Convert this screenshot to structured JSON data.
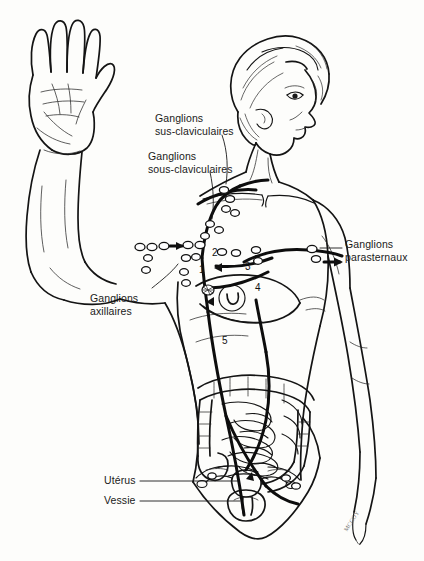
{
  "figure": {
    "language": "fr",
    "background_color": "#fdfdfb",
    "ink_color": "#111111",
    "width": 424,
    "height": 561
  },
  "labels": [
    {
      "id": "supraclavicular",
      "line1": "Ganglions",
      "line2": "sus-claviculaires",
      "x": 155,
      "y": 112,
      "align": "left"
    },
    {
      "id": "infraclavicular",
      "line1": "Ganglions",
      "line2": "sous-claviculaires",
      "x": 148,
      "y": 150,
      "align": "left"
    },
    {
      "id": "parasternal",
      "line1": "Ganglions",
      "line2": "parasternaux",
      "x": 345,
      "y": 238,
      "align": "left"
    },
    {
      "id": "axillary",
      "line1": "Ganglions",
      "line2": "axillaires",
      "x": 90,
      "y": 292,
      "align": "left"
    }
  ],
  "organ_labels": [
    {
      "id": "uterus",
      "text": "Utérus",
      "x": 104,
      "y": 481
    },
    {
      "id": "bladder",
      "text": "Vessie",
      "x": 104,
      "y": 501
    }
  ],
  "number_markers": [
    {
      "id": "marker-1",
      "text": "1",
      "x": 199,
      "y": 265
    },
    {
      "id": "marker-2",
      "text": "2",
      "x": 212,
      "y": 253
    },
    {
      "id": "marker-3",
      "text": "3",
      "x": 245,
      "y": 264
    },
    {
      "id": "marker-4",
      "text": "4",
      "x": 255,
      "y": 285
    },
    {
      "id": "marker-5",
      "text": "5",
      "x": 222,
      "y": 338
    }
  ],
  "signature": {
    "text": "MCCOY",
    "x": 352,
    "y": 520
  },
  "anatomy_parts": [
    "raised-left-hand",
    "raised-left-arm",
    "head-profile",
    "neck",
    "torso",
    "breast",
    "right-arm",
    "intestines",
    "uterus",
    "bladder",
    "pelvic-outline"
  ],
  "lymph_features": [
    "supraclavicular-node-chain",
    "infraclavicular-node-chain",
    "axillary-node-chain",
    "parasternal-node-chain",
    "lymphatic-drainage-arrows",
    "thoracic-duct-pathway"
  ]
}
